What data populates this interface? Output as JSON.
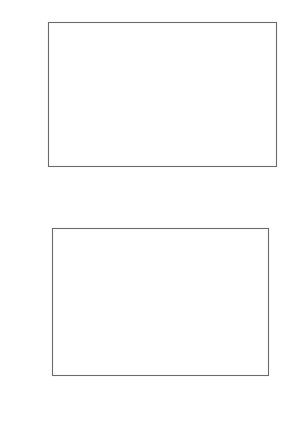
{
  "figure": {
    "background_color": "#ffffff",
    "ink_color": "#4a4a4a",
    "marker_color": "#5a5a5a"
  },
  "chart_data": [
    {
      "id": "top-panel",
      "type": "scatter",
      "title": "",
      "annotation": "Ants",
      "xlabel": "Log (colony size)",
      "ylabel": "Chromosome number (2n)",
      "xlim": [
        0,
        10
      ],
      "ylim": [
        0,
        100
      ],
      "xticks": [
        0,
        2,
        4,
        6,
        8,
        10
      ],
      "xticklabels": [
        "0",
        "2",
        "4",
        "6",
        "8",
        "10"
      ],
      "yticks": [
        0,
        25,
        50,
        75,
        100
      ],
      "yticklabels": [
        "0",
        "25",
        "50",
        "75",
        "100"
      ],
      "grid": false,
      "legend": "none",
      "marker": "open-circle",
      "points": [
        {
          "x": 1.82,
          "y": 94
        },
        {
          "x": 2.42,
          "y": 81
        },
        {
          "x": 2.55,
          "y": 84
        },
        {
          "x": 1.44,
          "y": 60
        },
        {
          "x": 8.48,
          "y": 52
        },
        {
          "x": 2.86,
          "y": 52
        },
        {
          "x": 3.32,
          "y": 53
        },
        {
          "x": 3.34,
          "y": 50
        },
        {
          "x": 2.22,
          "y": 48
        },
        {
          "x": 2.26,
          "y": 45
        },
        {
          "x": 3.05,
          "y": 49
        },
        {
          "x": 3.02,
          "y": 47
        },
        {
          "x": 3.46,
          "y": 46
        },
        {
          "x": 4.12,
          "y": 46
        },
        {
          "x": 2.55,
          "y": 43
        },
        {
          "x": 2.52,
          "y": 40
        },
        {
          "x": 2.6,
          "y": 38
        },
        {
          "x": 5.22,
          "y": 42
        },
        {
          "x": 1.5,
          "y": 36
        },
        {
          "x": 3.18,
          "y": 37
        },
        {
          "x": 3.78,
          "y": 35
        },
        {
          "x": 2.12,
          "y": 32
        },
        {
          "x": 2.68,
          "y": 32
        },
        {
          "x": 3.0,
          "y": 33
        },
        {
          "x": 3.38,
          "y": 32
        },
        {
          "x": 3.52,
          "y": 32
        },
        {
          "x": 3.62,
          "y": 32
        },
        {
          "x": 3.7,
          "y": 32
        },
        {
          "x": 3.78,
          "y": 32
        },
        {
          "x": 3.86,
          "y": 32
        },
        {
          "x": 3.92,
          "y": 31
        },
        {
          "x": 3.86,
          "y": 29
        },
        {
          "x": 3.96,
          "y": 33
        },
        {
          "x": 4.08,
          "y": 32
        },
        {
          "x": 5.46,
          "y": 32
        },
        {
          "x": 5.4,
          "y": 28
        },
        {
          "x": 5.58,
          "y": 24
        },
        {
          "x": 1.7,
          "y": 27
        },
        {
          "x": 1.74,
          "y": 25
        },
        {
          "x": 1.62,
          "y": 24
        },
        {
          "x": 1.8,
          "y": 23
        },
        {
          "x": 1.86,
          "y": 18
        },
        {
          "x": 2.14,
          "y": 22
        },
        {
          "x": 2.28,
          "y": 22
        },
        {
          "x": 2.22,
          "y": 18
        },
        {
          "x": 3.02,
          "y": 25
        },
        {
          "x": 3.06,
          "y": 23
        },
        {
          "x": 3.12,
          "y": 22
        },
        {
          "x": 3.18,
          "y": 21
        },
        {
          "x": 3.22,
          "y": 19
        },
        {
          "x": 3.26,
          "y": 17
        },
        {
          "x": 3.44,
          "y": 17
        },
        {
          "x": 3.6,
          "y": 20
        },
        {
          "x": 4.4,
          "y": 24
        },
        {
          "x": 4.46,
          "y": 22
        },
        {
          "x": 4.1,
          "y": 18
        },
        {
          "x": 5.16,
          "y": 18
        },
        {
          "x": 5.98,
          "y": 18
        },
        {
          "x": 1.82,
          "y": 8
        }
      ]
    },
    {
      "id": "bottom-panel",
      "type": "scatter",
      "title": "",
      "annotation": "Ants",
      "xlabel": "Contrast in log (colony size)",
      "ylabel": "Contrast in chromosome number",
      "xlim": [
        -0.18,
        3.0
      ],
      "ylim": [
        -25,
        10
      ],
      "xticks": [
        0,
        1,
        2,
        3
      ],
      "xticklabels": [
        "0",
        "1",
        "2",
        "3"
      ],
      "yticks": [
        10,
        5,
        0,
        -5,
        -10,
        -15,
        -20,
        -25
      ],
      "yticklabels": [
        "10",
        "5",
        "0",
        "- 5",
        "- 10",
        "- 15",
        "- 20",
        "- 25"
      ],
      "grid": false,
      "legend": "none",
      "marker": "open-circle",
      "reference_lines": [
        {
          "orientation": "vertical",
          "value": 0,
          "style": "dashed"
        },
        {
          "orientation": "horizontal",
          "value": 0,
          "style": "dashed"
        }
      ],
      "points": [
        {
          "x": 0.82,
          "y": 7.8
        },
        {
          "x": 0.9,
          "y": 5.8
        },
        {
          "x": 0.7,
          "y": 3.8
        },
        {
          "x": 0.86,
          "y": 4.0
        },
        {
          "x": 0.32,
          "y": 1.8
        },
        {
          "x": 1.06,
          "y": 1.8
        },
        {
          "x": 0.3,
          "y": 0.0
        },
        {
          "x": 0.31,
          "y": -0.3
        },
        {
          "x": 0.33,
          "y": -0.6
        },
        {
          "x": 0.66,
          "y": 0.0
        },
        {
          "x": 0.68,
          "y": -0.3
        },
        {
          "x": 0.7,
          "y": 0.0
        },
        {
          "x": 0.78,
          "y": -1.0
        },
        {
          "x": 2.58,
          "y": -1.0
        },
        {
          "x": 0.14,
          "y": -3.0
        },
        {
          "x": 0.3,
          "y": -3.0
        },
        {
          "x": 0.36,
          "y": -3.2
        },
        {
          "x": 0.44,
          "y": -3.1
        },
        {
          "x": 1.0,
          "y": -6.0
        },
        {
          "x": 0.48,
          "y": -7.2
        },
        {
          "x": 0.54,
          "y": -7.8
        },
        {
          "x": 0.03,
          "y": -7.4
        },
        {
          "x": 0.03,
          "y": -9.9
        },
        {
          "x": 0.39,
          "y": -10.9
        },
        {
          "x": 0.19,
          "y": -13.6
        },
        {
          "x": 0.4,
          "y": -20.5
        }
      ]
    }
  ]
}
